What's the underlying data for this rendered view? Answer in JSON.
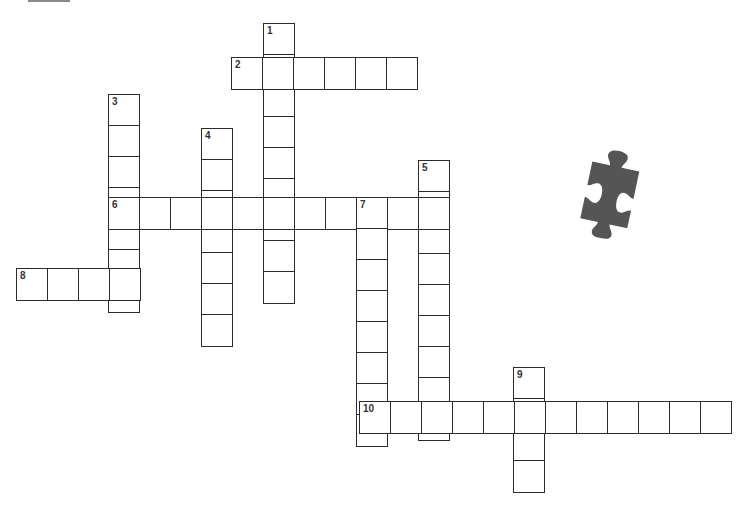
{
  "puzzle": {
    "type": "crossword",
    "cell_size": 31,
    "line_color": "#2b2b2b",
    "piece_color": "#555555",
    "entries": [
      {
        "number": "1",
        "direction": "down",
        "x": 263,
        "y": 23,
        "length": 9
      },
      {
        "number": "2",
        "direction": "across",
        "x": 231,
        "y": 57,
        "length": 6
      },
      {
        "number": "3",
        "direction": "down",
        "x": 108,
        "y": 94,
        "length": 7
      },
      {
        "number": "4",
        "direction": "down",
        "x": 201,
        "y": 128,
        "length": 7
      },
      {
        "number": "5",
        "direction": "down",
        "x": 418,
        "y": 160,
        "length": 9
      },
      {
        "number": "6",
        "direction": "across",
        "x": 108,
        "y": 197,
        "length": 11
      },
      {
        "number": "7",
        "direction": "down",
        "x": 356,
        "y": 197,
        "length": 8
      },
      {
        "number": "8",
        "direction": "across",
        "x": 16,
        "y": 268,
        "length": 4
      },
      {
        "number": "9",
        "direction": "down",
        "x": 513,
        "y": 367,
        "length": 4
      },
      {
        "number": "10",
        "direction": "across",
        "x": 359,
        "y": 401,
        "length": 12
      }
    ]
  },
  "decoration": {
    "icon": "puzzle-piece-icon"
  }
}
